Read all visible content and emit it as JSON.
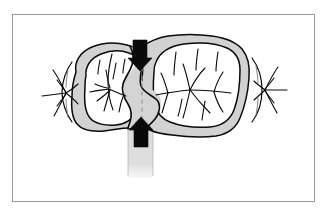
{
  "figure": {
    "caption": "",
    "frame": {
      "border_color": "#9a9a9a",
      "background_color": "#ffffff",
      "x": 12,
      "y": 14,
      "width": 303,
      "height": 188
    },
    "colors": {
      "outline": "#0a0a0a",
      "enamel_band_fill": "#d2d2d2",
      "isthmus_fill": "#d4d4d4",
      "root_shaft_fill": "#dcdcdc",
      "arrow_fill": "#0a0a0a",
      "dashed_line": "#8a8a8a",
      "fissure_line": "#1a1a1a",
      "page_background": "#ffffff"
    },
    "elements": [
      {
        "name": "left-molar-crown",
        "label": "Left molar crown",
        "cusp_count": 2
      },
      {
        "name": "right-molar-crown",
        "label": "Right molar crown",
        "cusp_count": 4
      },
      {
        "name": "central-isthmus",
        "label": "Central isthmus (prepared cavity)"
      },
      {
        "name": "root-shaft",
        "label": "Root shaft"
      },
      {
        "name": "top-force-arrow",
        "label": "Downward force arrow",
        "direction": "down"
      },
      {
        "name": "bottom-force-arrow",
        "label": "Upward force arrow",
        "direction": "up"
      },
      {
        "name": "left-adjacent-tooth",
        "label": "Left adjacent tooth fragment"
      },
      {
        "name": "right-adjacent-tooth",
        "label": "Right adjacent tooth fragment"
      },
      {
        "name": "isthmus-dashed-line",
        "label": "Dashed midline through isthmus"
      }
    ]
  }
}
